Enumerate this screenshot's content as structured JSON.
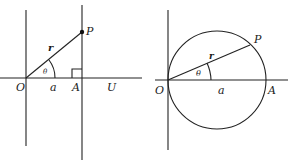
{
  "figures": [
    {
      "id": "left",
      "description": "Point P on vertical line through A, right angle at A",
      "labels": {
        "origin": "O",
        "point_p": "P",
        "radius": "r",
        "angle": "θ",
        "distance": "a",
        "point_a": "A",
        "axis_end": "U"
      }
    },
    {
      "id": "right",
      "description": "Circle through O and A with P on circle",
      "labels": {
        "origin": "O",
        "point_p": "P",
        "radius": "r",
        "angle": "θ",
        "distance": "a",
        "point_a": "A"
      }
    }
  ],
  "colors": {
    "line": "#222222",
    "background": "#ffffff"
  }
}
